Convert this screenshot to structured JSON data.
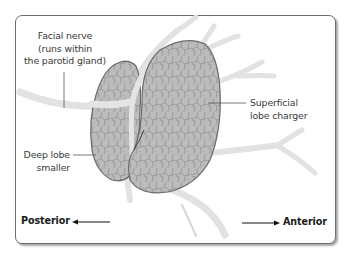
{
  "diagram": {
    "labels": {
      "facial_nerve": {
        "line1": "Facial nerve",
        "line2": "(runs within",
        "line3": "the parotid gland)"
      },
      "superficial_lobe": {
        "line1": "Superficial",
        "line2": "lobe charger"
      },
      "deep_lobe": {
        "line1": "Deep lobe",
        "line2": "smaller"
      }
    },
    "orientation": {
      "posterior": "Posterior",
      "anterior": "Anterior"
    },
    "colors": {
      "nerve": "#e3e3e3",
      "gland_fill": "#b9b9b9",
      "gland_outline": "#6a6a6a",
      "frame_border": "#6e6e6e",
      "label_text": "#3a3a3a",
      "direction_text": "#1a1a1a"
    }
  }
}
